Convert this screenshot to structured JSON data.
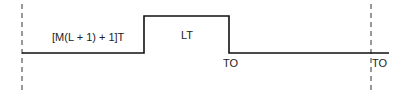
{
  "diagram": {
    "type": "timing-waveform",
    "labels": {
      "low_interval": "[M(L + 1) + 1]T",
      "high_interval": "LT",
      "fall_marker": "TO",
      "end_marker": "TO"
    },
    "colors": {
      "line": "#111111",
      "dashed": "#333333"
    }
  }
}
